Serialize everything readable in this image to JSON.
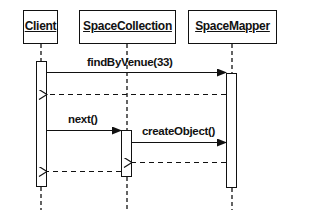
{
  "diagram": {
    "type": "sequence",
    "participants": [
      {
        "name": "Client"
      },
      {
        "name": "SpaceCollection"
      },
      {
        "name": "SpaceMapper"
      }
    ],
    "messages": [
      {
        "from": "Client",
        "to": "SpaceMapper",
        "label": "findByVenue(33)",
        "style": "solid"
      },
      {
        "from": "SpaceMapper",
        "to": "Client",
        "label": "",
        "style": "dashed-return"
      },
      {
        "from": "Client",
        "to": "SpaceCollection",
        "label": "next()",
        "style": "solid"
      },
      {
        "from": "SpaceCollection",
        "to": "SpaceMapper",
        "label": "createObject()",
        "style": "solid"
      },
      {
        "from": "SpaceMapper",
        "to": "SpaceCollection",
        "label": "",
        "style": "dashed-return"
      },
      {
        "from": "SpaceCollection",
        "to": "Client",
        "label": "",
        "style": "dashed-return"
      }
    ]
  }
}
